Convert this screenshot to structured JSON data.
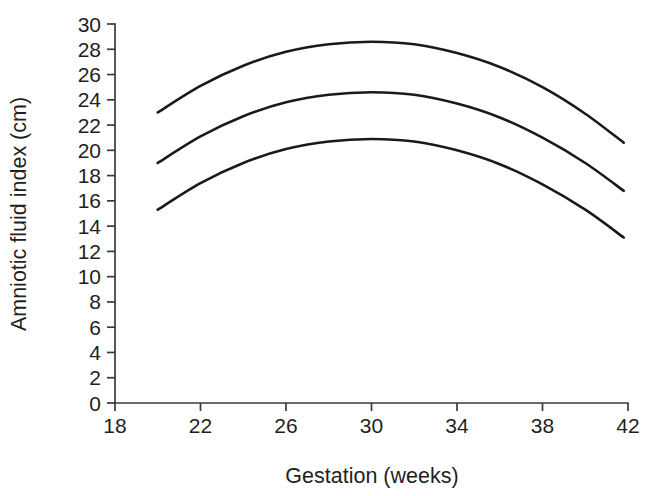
{
  "chart_data": {
    "type": "line",
    "title": "",
    "xlabel": "Gestation (weeks)",
    "ylabel": "Amniotic fluid index (cm)",
    "xlim": [
      18,
      42
    ],
    "ylim": [
      0,
      30
    ],
    "xticks": [
      18,
      22,
      26,
      30,
      34,
      38,
      42
    ],
    "yticks": [
      0,
      2,
      4,
      6,
      8,
      10,
      12,
      14,
      16,
      18,
      20,
      22,
      24,
      26,
      28,
      30
    ],
    "grid": false,
    "legend": null,
    "x": [
      20,
      22,
      24,
      26,
      28,
      30,
      32,
      34,
      36,
      38,
      40,
      41.8
    ],
    "series": [
      {
        "name": "upper-curve",
        "values": [
          23.0,
          25.1,
          26.7,
          27.8,
          28.4,
          28.6,
          28.4,
          27.7,
          26.6,
          25.0,
          22.9,
          20.6
        ]
      },
      {
        "name": "middle-curve",
        "values": [
          19.0,
          21.1,
          22.7,
          23.8,
          24.4,
          24.6,
          24.4,
          23.7,
          22.6,
          21.0,
          19.0,
          16.8
        ]
      },
      {
        "name": "lower-curve",
        "values": [
          15.3,
          17.4,
          19.0,
          20.1,
          20.7,
          20.9,
          20.7,
          20.0,
          18.9,
          17.3,
          15.3,
          13.1
        ]
      }
    ],
    "axis_color": "#3a3a3a",
    "curve_color": "#1a1a1a",
    "background_color": "#ffffff"
  },
  "geometry": {
    "plot_left": 115,
    "plot_right": 628,
    "plot_bottom": 403,
    "plot_top": 24,
    "tick_length": 8,
    "y_label_x": 26,
    "y_label_y": 214,
    "x_label_x": 372,
    "x_label_y": 483
  }
}
